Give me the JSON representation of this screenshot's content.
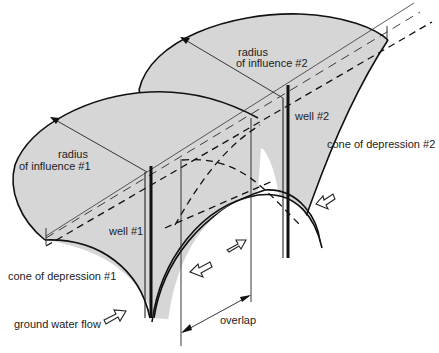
{
  "diagram": {
    "type": "overlapping cones of depression of two wells",
    "labels": {
      "radius1": [
        "radius",
        "of influence #1"
      ],
      "radius2": [
        "radius",
        "of influence #2"
      ],
      "well1": "well #1",
      "well2": "well #2",
      "cone1": "cone of depression #1",
      "cone2": "cone of depression #2",
      "flow": "ground water flow",
      "overlap": "overlap"
    },
    "colors": {
      "cone_fill": "#d6d6d6",
      "line": "#111111"
    }
  }
}
